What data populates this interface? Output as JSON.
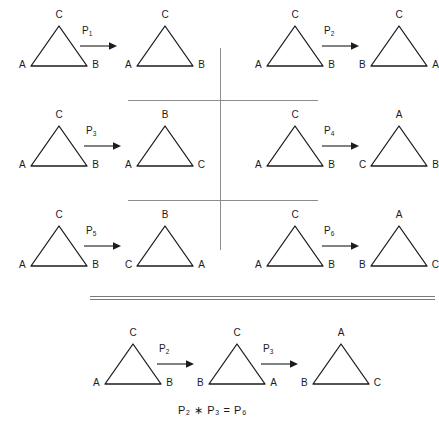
{
  "figure": {
    "equation": "P₂ ∗ P₃ = P₆",
    "line_color": "#1c1c1c",
    "divider_color": "#8c8c8c",
    "background": "#ffffff"
  },
  "mappings": [
    {
      "id": "P1",
      "operator": "P",
      "subscript": "1",
      "source": {
        "apex": "C",
        "left": "A",
        "right": "B"
      },
      "result": {
        "apex": "C",
        "left": "A",
        "right": "B"
      }
    },
    {
      "id": "P2",
      "operator": "P",
      "subscript": "2",
      "source": {
        "apex": "C",
        "left": "A",
        "right": "B"
      },
      "result": {
        "apex": "C",
        "left": "B",
        "right": "A"
      }
    },
    {
      "id": "P3",
      "operator": "P",
      "subscript": "3",
      "source": {
        "apex": "C",
        "left": "A",
        "right": "B"
      },
      "result": {
        "apex": "B",
        "left": "A",
        "right": "C"
      }
    },
    {
      "id": "P4",
      "operator": "P",
      "subscript": "4",
      "source": {
        "apex": "C",
        "left": "A",
        "right": "B"
      },
      "result": {
        "apex": "A",
        "left": "C",
        "right": "B"
      }
    },
    {
      "id": "P5",
      "operator": "P",
      "subscript": "5",
      "source": {
        "apex": "C",
        "left": "A",
        "right": "B"
      },
      "result": {
        "apex": "B",
        "left": "C",
        "right": "A"
      }
    },
    {
      "id": "P6",
      "operator": "P",
      "subscript": "6",
      "source": {
        "apex": "C",
        "left": "A",
        "right": "B"
      },
      "result": {
        "apex": "A",
        "left": "B",
        "right": "C"
      }
    }
  ],
  "composition": {
    "steps": [
      {
        "apex": "C",
        "left": "A",
        "right": "B"
      },
      {
        "apex": "C",
        "left": "B",
        "right": "A"
      },
      {
        "apex": "A",
        "left": "B",
        "right": "C"
      }
    ],
    "arrows": [
      {
        "operator": "P",
        "subscript": "2"
      },
      {
        "operator": "P",
        "subscript": "3"
      }
    ],
    "equation": "P₂ ∗ P₃ = P₆"
  }
}
